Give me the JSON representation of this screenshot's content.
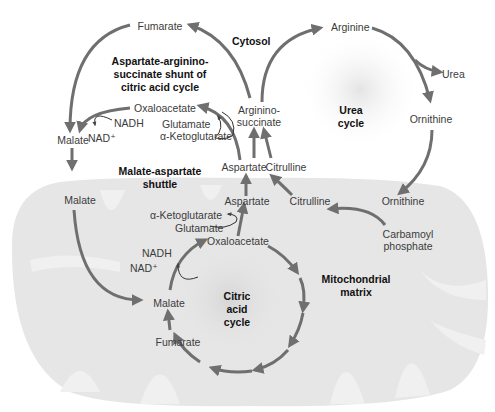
{
  "regions": {
    "cytosol": "Cytosol",
    "mitochondrial_matrix": "Mitochondrial\nmatrix"
  },
  "pathway_titles": {
    "shunt": "Aspartate-arginino-\nsuccinate shunt of\ncitric acid cycle",
    "urea_cycle": "Urea\ncycle",
    "malate_aspartate_shuttle": "Malate-aspartate\nshuttle",
    "citric_acid_cycle": "Citric\nacid\ncycle"
  },
  "metabolites": {
    "cytosol_fumarate": "Fumarate",
    "cytosol_oxaloacetate": "Oxaloacetate",
    "cytosol_nadh": "NADH",
    "cytosol_nad": "NAD⁺",
    "cytosol_glutamate": "Glutamate",
    "cytosol_aketoglutarate": "α-Ketoglutarate",
    "cytosol_malate": "Malate",
    "cytosol_aspartate": "Aspartate",
    "argininosuccinate": "Arginino-\nsuccinate",
    "cytosol_citrulline": "Citrulline",
    "arginine": "Arginine",
    "urea": "Urea",
    "cytosol_ornithine": "Ornithine",
    "mito_malate_top": "Malate",
    "mito_aspartate": "Aspartate",
    "mito_citrulline": "Citrulline",
    "mito_ornithine": "Ornithine",
    "carbamoyl_phosphate": "Carbamoyl\nphosphate",
    "mito_aketoglutarate": "α-Ketoglutarate",
    "mito_glutamate": "Glutamate",
    "mito_oxaloacetate": "Oxaloacetate",
    "mito_nadh": "NADH",
    "mito_nad": "NAD⁺",
    "mito_malate": "Malate",
    "mito_fumarate": "Fumarate"
  },
  "colors": {
    "arrow": "#6f6f6f",
    "mitochondrion_fill": "#e6e6e6",
    "cristae_fill": "#f2f2f2",
    "text": "#3c3c3c"
  }
}
